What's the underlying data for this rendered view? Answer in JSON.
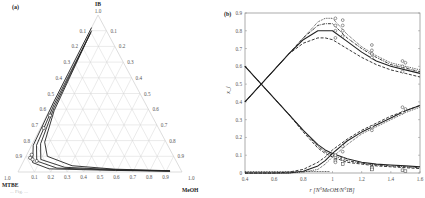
{
  "figure": {
    "panel_a_label": "(a)",
    "panel_b_label": "(b)",
    "caption_fragment": "... Fig. ..."
  },
  "chart_data": [
    {
      "type": "ternary",
      "panel": "(a)",
      "vertices": {
        "top": "IB",
        "bottom_left": "MTBE",
        "bottom_right": "MeOH"
      },
      "vertex_values": {
        "top": "1.0",
        "bottom_left": "1.0",
        "bottom_right": "1.0"
      },
      "left_edge_ticks": [
        "0.1",
        "0.2",
        "0.3",
        "0.4",
        "0.5",
        "0.6",
        "0.7",
        "0.8",
        "0.9"
      ],
      "right_edge_ticks": [
        "0.1",
        "0.2",
        "0.3",
        "0.4",
        "0.5",
        "0.6",
        "0.7",
        "0.8",
        "0.9"
      ],
      "bottom_edge_ticks": [
        "0.1",
        "0.2",
        "0.3",
        "0.4",
        "0.5",
        "0.6",
        "0.7",
        "0.8",
        "0.9"
      ],
      "grid": true,
      "series_description": "Several residue/composition trajectories running from near IB apex down the MTBE–IB edge toward MTBE corner, then along the MTBE–MeOH base toward MeOH corner; open markers clustered near MTBE corner (x_MTBE 0.6–0.9).",
      "curves": [
        {
          "name": "curve1",
          "points": [
            [
              0.08,
              0.92
            ],
            [
              0.55,
              0.45
            ],
            [
              0.82,
              0.17
            ],
            [
              0.88,
              0.06
            ],
            [
              0.8,
              0.02
            ],
            [
              0.4,
              0.01
            ],
            [
              0.07,
              0.005
            ]
          ]
        },
        {
          "name": "curve2",
          "points": [
            [
              0.09,
              0.9
            ],
            [
              0.56,
              0.43
            ],
            [
              0.8,
              0.17
            ],
            [
              0.85,
              0.07
            ],
            [
              0.75,
              0.025
            ],
            [
              0.4,
              0.012
            ],
            [
              0.07,
              0.006
            ]
          ]
        },
        {
          "name": "curve3",
          "points": [
            [
              0.1,
              0.89
            ],
            [
              0.57,
              0.41
            ],
            [
              0.77,
              0.18
            ],
            [
              0.82,
              0.08
            ],
            [
              0.7,
              0.03
            ],
            [
              0.4,
              0.015
            ],
            [
              0.07,
              0.007
            ]
          ]
        },
        {
          "name": "curve4",
          "points": [
            [
              0.11,
              0.88
            ],
            [
              0.58,
              0.39
            ],
            [
              0.74,
              0.19
            ],
            [
              0.77,
              0.1
            ],
            [
              0.65,
              0.04
            ],
            [
              0.4,
              0.018
            ],
            [
              0.07,
              0.008
            ]
          ]
        }
      ],
      "markers": [
        [
          0.62,
          0.36
        ],
        [
          0.7,
          0.28
        ],
        [
          0.86,
          0.11
        ],
        [
          0.88,
          0.09
        ],
        [
          0.87,
          0.08
        ],
        [
          0.85,
          0.07
        ]
      ]
    },
    {
      "type": "line",
      "panel": "(b)",
      "title": "",
      "xlabel": "r [N°MeOH/N°IB]",
      "ylabel": "x_i",
      "xlim": [
        0.4,
        1.6
      ],
      "ylim": [
        0,
        0.9
      ],
      "xticks": [
        "0.4",
        "0.6",
        "0.8",
        "1",
        "1.2",
        "1.4",
        "1.6"
      ],
      "yticks": [
        "0",
        "0.1",
        "0.2",
        "0.3",
        "0.4",
        "0.5",
        "0.6",
        "0.7",
        "0.8",
        "0.9"
      ],
      "grid": false,
      "x": [
        0.4,
        0.5,
        0.6,
        0.7,
        0.8,
        0.9,
        0.95,
        1.0,
        1.1,
        1.2,
        1.3,
        1.4,
        1.5,
        1.6
      ],
      "series": [
        {
          "name": "MTBE (dotted)",
          "style": "dotted",
          "values": [
            0.4,
            0.49,
            0.58,
            0.67,
            0.76,
            0.85,
            0.87,
            0.87,
            0.78,
            0.71,
            0.66,
            0.62,
            0.6,
            0.58
          ]
        },
        {
          "name": "MTBE (dash-dot)",
          "style": "dashdot",
          "values": [
            0.4,
            0.49,
            0.58,
            0.67,
            0.76,
            0.83,
            0.84,
            0.84,
            0.76,
            0.7,
            0.65,
            0.61,
            0.59,
            0.57
          ]
        },
        {
          "name": "MTBE (solid)",
          "style": "solid",
          "values": [
            0.4,
            0.49,
            0.58,
            0.67,
            0.75,
            0.8,
            0.8,
            0.8,
            0.74,
            0.68,
            0.63,
            0.6,
            0.58,
            0.56
          ]
        },
        {
          "name": "MTBE (dashed)",
          "style": "dashed",
          "values": [
            0.4,
            0.49,
            0.58,
            0.67,
            0.73,
            0.76,
            0.76,
            0.75,
            0.7,
            0.65,
            0.61,
            0.58,
            0.56,
            0.54
          ]
        },
        {
          "name": "IB (solid)",
          "style": "solid",
          "values": [
            0.6,
            0.51,
            0.42,
            0.33,
            0.24,
            0.16,
            0.13,
            0.11,
            0.08,
            0.06,
            0.05,
            0.045,
            0.04,
            0.035
          ]
        },
        {
          "name": "IB (dash-dot)",
          "style": "dashdot",
          "values": [
            0.6,
            0.51,
            0.42,
            0.33,
            0.24,
            0.15,
            0.12,
            0.1,
            0.07,
            0.055,
            0.045,
            0.04,
            0.035,
            0.03
          ]
        },
        {
          "name": "IB (dashed)",
          "style": "dashed",
          "values": [
            0.6,
            0.51,
            0.42,
            0.33,
            0.23,
            0.14,
            0.11,
            0.09,
            0.06,
            0.05,
            0.04,
            0.035,
            0.03,
            0.025
          ]
        },
        {
          "name": "MeOH (dashed)",
          "style": "dashed",
          "values": [
            0.0,
            0.0,
            0.0,
            0.005,
            0.02,
            0.06,
            0.09,
            0.13,
            0.19,
            0.24,
            0.28,
            0.32,
            0.35,
            0.38
          ]
        },
        {
          "name": "MeOH (solid)",
          "style": "solid",
          "values": [
            0.0,
            0.0,
            0.0,
            0.0,
            0.01,
            0.04,
            0.07,
            0.11,
            0.18,
            0.23,
            0.27,
            0.31,
            0.35,
            0.38
          ]
        },
        {
          "name": "MeOH (dotted)",
          "style": "dotted",
          "values": [
            0.0,
            0.0,
            0.0,
            0.0,
            0.005,
            0.02,
            0.05,
            0.09,
            0.16,
            0.22,
            0.26,
            0.3,
            0.34,
            0.37
          ]
        }
      ],
      "markers": {
        "x_positions": [
          1.02,
          1.07,
          1.27,
          1.48,
          1.5
        ],
        "MTBE": [
          [
            1.02,
            0.87
          ],
          [
            1.02,
            0.83
          ],
          [
            1.02,
            0.8
          ],
          [
            1.02,
            0.76
          ],
          [
            1.07,
            0.86
          ],
          [
            1.07,
            0.83
          ],
          [
            1.07,
            0.8
          ],
          [
            1.07,
            0.77
          ],
          [
            1.27,
            0.72
          ],
          [
            1.27,
            0.69
          ],
          [
            1.27,
            0.67
          ],
          [
            1.27,
            0.65
          ],
          [
            1.48,
            0.63
          ],
          [
            1.48,
            0.6
          ],
          [
            1.48,
            0.57
          ],
          [
            1.5,
            0.62
          ],
          [
            1.5,
            0.59
          ]
        ],
        "IB": [
          [
            1.02,
            0.09
          ],
          [
            1.02,
            0.07
          ],
          [
            1.07,
            0.08
          ],
          [
            1.07,
            0.05
          ],
          [
            1.27,
            0.03
          ],
          [
            1.27,
            0.02
          ],
          [
            1.48,
            0.015
          ],
          [
            1.5,
            0.01
          ]
        ],
        "MeOH": [
          [
            1.02,
            0.1
          ],
          [
            1.02,
            0.06
          ],
          [
            1.07,
            0.15
          ],
          [
            1.07,
            0.12
          ],
          [
            1.27,
            0.26
          ],
          [
            1.27,
            0.24
          ],
          [
            1.48,
            0.37
          ],
          [
            1.48,
            0.34
          ],
          [
            1.5,
            0.36
          ]
        ]
      }
    }
  ]
}
